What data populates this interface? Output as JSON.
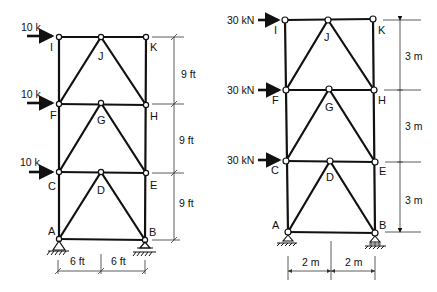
{
  "figures": [
    {
      "name": "left-truss",
      "loads": [
        {
          "joint": "I",
          "label": "10 k"
        },
        {
          "joint": "F",
          "label": "10 k"
        },
        {
          "joint": "C",
          "label": "10 k"
        }
      ],
      "joints": {
        "I": "I",
        "J": "J",
        "K": "K",
        "F": "F",
        "G": "G",
        "H": "H",
        "C": "C",
        "D": "D",
        "E": "E",
        "A": "A",
        "B": "B"
      },
      "vertical_dims": [
        "9 ft",
        "9 ft",
        "9 ft"
      ],
      "horizontal_dims": [
        "6 ft",
        "6 ft"
      ]
    },
    {
      "name": "right-truss",
      "loads": [
        {
          "joint": "I",
          "label": "30 kN"
        },
        {
          "joint": "F",
          "label": "30 kN"
        },
        {
          "joint": "C",
          "label": "30 kN"
        }
      ],
      "joints": {
        "I": "I",
        "J": "J",
        "K": "K",
        "F": "F",
        "G": "G",
        "H": "H",
        "C": "C",
        "D": "D",
        "E": "E",
        "A": "A",
        "B": "B"
      },
      "vertical_dims": [
        "3 m",
        "3 m",
        "3 m"
      ],
      "horizontal_dims": [
        "2 m",
        "2 m"
      ]
    }
  ]
}
